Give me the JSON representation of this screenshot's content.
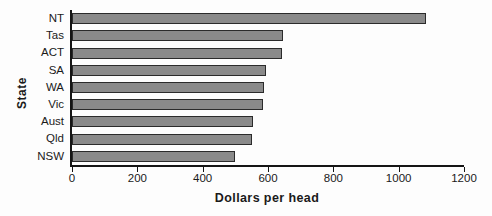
{
  "chart_data": {
    "type": "bar",
    "orientation": "horizontal",
    "title": "",
    "xlabel": "Dollars  per  head",
    "ylabel": "State",
    "categories": [
      "NT",
      "Tas",
      "ACT",
      "SA",
      "WA",
      "Vic",
      "Aust",
      "Qld",
      "NSW"
    ],
    "values": [
      1085,
      647,
      643,
      594,
      588,
      585,
      554,
      551,
      498
    ],
    "xlim": [
      0,
      1200
    ],
    "xticks": [
      0,
      200,
      400,
      600,
      800,
      1000,
      1200
    ],
    "xtick_labels": [
      "0",
      "200",
      "400",
      "600",
      "800",
      "1000",
      "1200"
    ],
    "grid": false,
    "legend": "none",
    "bar_color": "#8a8a8a",
    "bar_edge_color": "#2b2b2b",
    "axis_color": "#151515",
    "background_color": "#fdfdfd"
  }
}
